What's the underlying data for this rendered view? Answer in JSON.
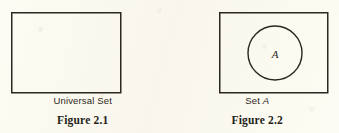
{
  "page": {
    "background_color": "#fdfcf4",
    "ink_color": "#2a2620"
  },
  "figures": [
    {
      "id": "figure-1",
      "caption": "Universal Set",
      "caption_plain": "Universal Set",
      "number": "Figure 2.1",
      "shapes": {
        "rectangle": {
          "label": "universal-set-rectangle",
          "x": 11,
          "y": 12,
          "width": 110,
          "height": 81
        }
      }
    },
    {
      "id": "figure-2",
      "caption_prefix": "Set ",
      "caption_variable": "A",
      "caption_plain": "Set A",
      "number": "Figure 2.2",
      "shapes": {
        "rectangle": {
          "label": "universal-set-rectangle",
          "x": 49,
          "y": 12,
          "width": 109,
          "height": 81
        },
        "circle": {
          "label": "set-a-circle",
          "cx": 105,
          "cy": 53,
          "r": 27,
          "inner_label": "A"
        }
      }
    }
  ]
}
